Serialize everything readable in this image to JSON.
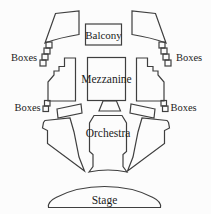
{
  "diagram": {
    "type": "theater-seating-map",
    "labels": {
      "balcony": "Balcony",
      "mezzanine": "Mezzanine",
      "orchestra": "Orchestra",
      "stage": "Stage",
      "boxes_upper_left": "Boxes",
      "boxes_upper_right": "Boxes",
      "boxes_lower_left": "Boxes",
      "boxes_lower_right": "Boxes"
    },
    "colors": {
      "outline": "#3f3f3f",
      "text": "#1c1c1c",
      "background": "#fcfcfc"
    }
  }
}
